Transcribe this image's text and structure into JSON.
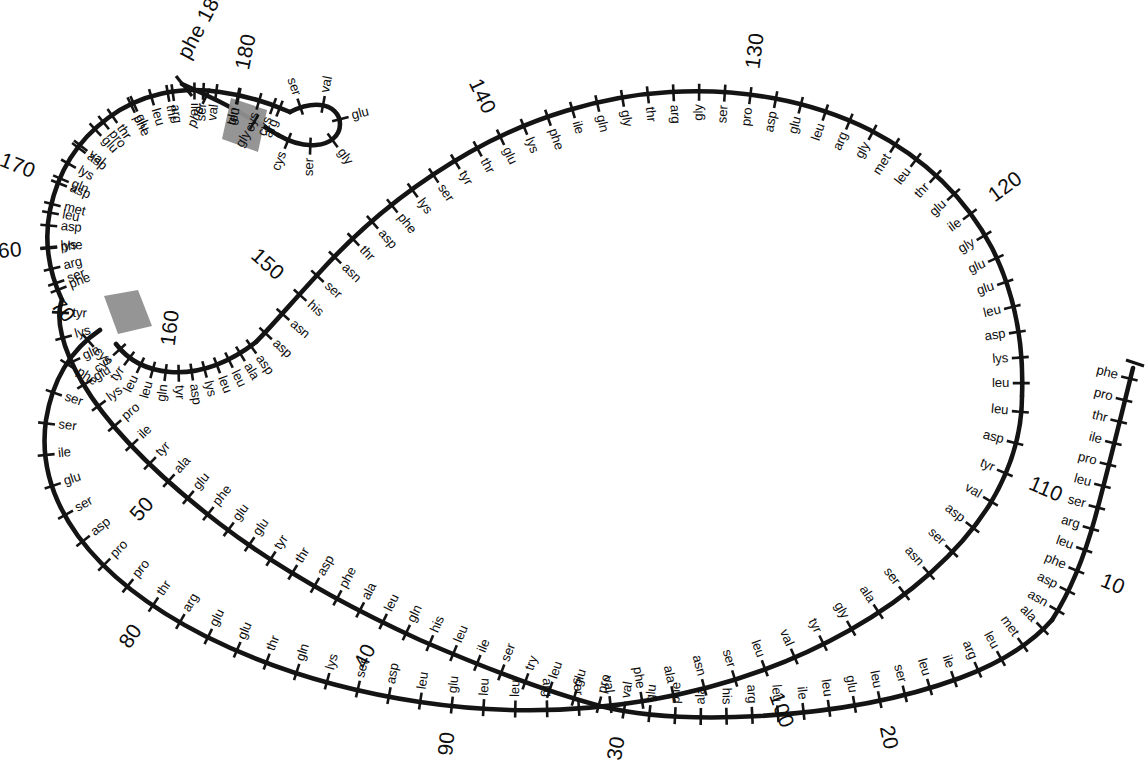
{
  "figure": {
    "type": "protein-sequence-loop-diagram",
    "title": "",
    "total_residues": 188,
    "numbering_interval": 10,
    "ink_color": "#141414",
    "disulfide_color": "#8f8f8f"
  },
  "chart_data": {
    "type": "diagram",
    "title": "",
    "xlabel": "",
    "ylabel": "",
    "numbering_labels": [
      "10",
      "20",
      "30",
      "40",
      "50",
      "60",
      "70",
      "80",
      "90",
      "100",
      "110",
      "120",
      "130",
      "140",
      "150",
      "160",
      "170",
      "180",
      "188"
    ],
    "disulfide_bonds": [
      {
        "label": "cys70-cys161",
        "from_residue": 70,
        "from_name": "cys",
        "to_residue": 161,
        "to_name": "cys"
      },
      {
        "label": "cys179-cys184",
        "from_residue": 179,
        "from_name": "cys",
        "to_residue": 184,
        "to_name": "cys"
      }
    ],
    "residues": [
      {
        "n": 1,
        "name": "phe"
      },
      {
        "n": 2,
        "name": "pro"
      },
      {
        "n": 3,
        "name": "thr"
      },
      {
        "n": 4,
        "name": "ile"
      },
      {
        "n": 5,
        "name": "pro"
      },
      {
        "n": 6,
        "name": "leu"
      },
      {
        "n": 7,
        "name": "ser"
      },
      {
        "n": 8,
        "name": "arg"
      },
      {
        "n": 9,
        "name": "leu"
      },
      {
        "n": 10,
        "name": "phe"
      },
      {
        "n": 11,
        "name": "asp"
      },
      {
        "n": 12,
        "name": "asn"
      },
      {
        "n": 13,
        "name": "ala"
      },
      {
        "n": 14,
        "name": "met"
      },
      {
        "n": 15,
        "name": "leu"
      },
      {
        "n": 16,
        "name": "arg"
      },
      {
        "n": 17,
        "name": "ile"
      },
      {
        "n": 18,
        "name": "leu"
      },
      {
        "n": 19,
        "name": "ser"
      },
      {
        "n": 20,
        "name": "leu"
      },
      {
        "n": 21,
        "name": "glu"
      },
      {
        "n": 22,
        "name": "leu"
      },
      {
        "n": 23,
        "name": "ile"
      },
      {
        "n": 24,
        "name": "leu"
      },
      {
        "n": 25,
        "name": "arg"
      },
      {
        "n": 26,
        "name": "his"
      },
      {
        "n": 27,
        "name": "ala"
      },
      {
        "n": 28,
        "name": "phe"
      },
      {
        "n": 29,
        "name": "glu"
      },
      {
        "n": 30,
        "name": "val"
      },
      {
        "n": 31,
        "name": "pro"
      },
      {
        "n": 32,
        "name": "glu"
      },
      {
        "n": 33,
        "name": "leu"
      },
      {
        "n": 34,
        "name": "try"
      },
      {
        "n": 35,
        "name": "ser"
      },
      {
        "n": 36,
        "name": "ile"
      },
      {
        "n": 37,
        "name": "leu"
      },
      {
        "n": 38,
        "name": "his"
      },
      {
        "n": 39,
        "name": "gln"
      },
      {
        "n": 40,
        "name": "leu"
      },
      {
        "n": 41,
        "name": "ala"
      },
      {
        "n": 42,
        "name": "phe"
      },
      {
        "n": 43,
        "name": "asp"
      },
      {
        "n": 44,
        "name": "thr"
      },
      {
        "n": 45,
        "name": "tyr"
      },
      {
        "n": 46,
        "name": "glu"
      },
      {
        "n": 47,
        "name": "glu"
      },
      {
        "n": 48,
        "name": "phe"
      },
      {
        "n": 49,
        "name": "glu"
      },
      {
        "n": 50,
        "name": "ala"
      },
      {
        "n": 51,
        "name": "tyr"
      },
      {
        "n": 52,
        "name": "ile"
      },
      {
        "n": 53,
        "name": "pro"
      },
      {
        "n": 54,
        "name": "lys"
      },
      {
        "n": 55,
        "name": "glu"
      },
      {
        "n": 56,
        "name": "gln"
      },
      {
        "n": 57,
        "name": "lys"
      },
      {
        "n": 58,
        "name": "tyr"
      },
      {
        "n": 59,
        "name": "ser"
      },
      {
        "n": 60,
        "name": "phe"
      },
      {
        "n": 61,
        "name": "leu"
      },
      {
        "n": 62,
        "name": "gln"
      },
      {
        "n": 63,
        "name": "asp"
      },
      {
        "n": 64,
        "name": "pro"
      },
      {
        "n": 65,
        "name": "glu"
      },
      {
        "n": 66,
        "name": "thr"
      },
      {
        "n": 67,
        "name": "ser"
      },
      {
        "n": 68,
        "name": "leu"
      },
      {
        "n": 69,
        "name": "cys"
      },
      {
        "n": 70,
        "name": "cys"
      },
      {
        "n": 71,
        "name": "phe"
      },
      {
        "n": 72,
        "name": "ser"
      },
      {
        "n": 73,
        "name": "ser"
      },
      {
        "n": 74,
        "name": "ile"
      },
      {
        "n": 75,
        "name": "glu"
      },
      {
        "n": 76,
        "name": "ser"
      },
      {
        "n": 77,
        "name": "asp"
      },
      {
        "n": 78,
        "name": "pro"
      },
      {
        "n": 79,
        "name": "pro"
      },
      {
        "n": 80,
        "name": "thr"
      },
      {
        "n": 81,
        "name": "arg"
      },
      {
        "n": 82,
        "name": "glu"
      },
      {
        "n": 83,
        "name": "glu"
      },
      {
        "n": 84,
        "name": "thr"
      },
      {
        "n": 85,
        "name": "gln"
      },
      {
        "n": 86,
        "name": "lys"
      },
      {
        "n": 87,
        "name": "ser"
      },
      {
        "n": 88,
        "name": "asp"
      },
      {
        "n": 89,
        "name": "leu"
      },
      {
        "n": 90,
        "name": "glu"
      },
      {
        "n": 91,
        "name": "leu"
      },
      {
        "n": 92,
        "name": "leu"
      },
      {
        "n": 93,
        "name": "arg"
      },
      {
        "n": 94,
        "name": "ser"
      },
      {
        "n": 95,
        "name": "val"
      },
      {
        "n": 96,
        "name": "phe"
      },
      {
        "n": 97,
        "name": "ala"
      },
      {
        "n": 98,
        "name": "asn"
      },
      {
        "n": 99,
        "name": "ser"
      },
      {
        "n": 100,
        "name": "leu"
      },
      {
        "n": 101,
        "name": "val"
      },
      {
        "n": 102,
        "name": "tyr"
      },
      {
        "n": 103,
        "name": "gly"
      },
      {
        "n": 104,
        "name": "ala"
      },
      {
        "n": 105,
        "name": "ser"
      },
      {
        "n": 106,
        "name": "asn"
      },
      {
        "n": 107,
        "name": "ser"
      },
      {
        "n": 108,
        "name": "asp"
      },
      {
        "n": 109,
        "name": "val"
      },
      {
        "n": 110,
        "name": "tyr"
      },
      {
        "n": 111,
        "name": "asp"
      },
      {
        "n": 112,
        "name": "leu"
      },
      {
        "n": 113,
        "name": "leu"
      },
      {
        "n": 114,
        "name": "lys"
      },
      {
        "n": 115,
        "name": "asp"
      },
      {
        "n": 116,
        "name": "leu"
      },
      {
        "n": 117,
        "name": "glu"
      },
      {
        "n": 118,
        "name": "glu"
      },
      {
        "n": 119,
        "name": "gly"
      },
      {
        "n": 120,
        "name": "ile"
      },
      {
        "n": 121,
        "name": "glu"
      },
      {
        "n": 122,
        "name": "thr"
      },
      {
        "n": 123,
        "name": "leu"
      },
      {
        "n": 124,
        "name": "met"
      },
      {
        "n": 125,
        "name": "gly"
      },
      {
        "n": 126,
        "name": "arg"
      },
      {
        "n": 127,
        "name": "leu"
      },
      {
        "n": 128,
        "name": "glu"
      },
      {
        "n": 129,
        "name": "asp"
      },
      {
        "n": 130,
        "name": "pro"
      },
      {
        "n": 131,
        "name": "ser"
      },
      {
        "n": 132,
        "name": "gly"
      },
      {
        "n": 133,
        "name": "arg"
      },
      {
        "n": 134,
        "name": "thr"
      },
      {
        "n": 135,
        "name": "gly"
      },
      {
        "n": 136,
        "name": "gln"
      },
      {
        "n": 137,
        "name": "ile"
      },
      {
        "n": 138,
        "name": "phe"
      },
      {
        "n": 139,
        "name": "lys"
      },
      {
        "n": 140,
        "name": "glu"
      },
      {
        "n": 141,
        "name": "thr"
      },
      {
        "n": 142,
        "name": "tyr"
      },
      {
        "n": 143,
        "name": "ser"
      },
      {
        "n": 144,
        "name": "lys"
      },
      {
        "n": 145,
        "name": "phe"
      },
      {
        "n": 146,
        "name": "asp"
      },
      {
        "n": 147,
        "name": "thr"
      },
      {
        "n": 148,
        "name": "asn"
      },
      {
        "n": 149,
        "name": "ser"
      },
      {
        "n": 150,
        "name": "his"
      },
      {
        "n": 151,
        "name": "asn"
      },
      {
        "n": 152,
        "name": "asp"
      },
      {
        "n": 153,
        "name": "asp"
      },
      {
        "n": 154,
        "name": "ala"
      },
      {
        "n": 155,
        "name": "leu"
      },
      {
        "n": 156,
        "name": "leu"
      },
      {
        "n": 157,
        "name": "lys"
      },
      {
        "n": 158,
        "name": "asp"
      },
      {
        "n": 159,
        "name": "tyr"
      },
      {
        "n": 160,
        "name": "gln"
      },
      {
        "n": 161,
        "name": "leu"
      },
      {
        "n": 162,
        "name": "leu"
      },
      {
        "n": 163,
        "name": "tyr"
      },
      {
        "n": 164,
        "name": "cys"
      },
      {
        "n": 165,
        "name": "phe"
      },
      {
        "n": 166,
        "name": "arg"
      },
      {
        "n": 167,
        "name": "lys"
      },
      {
        "n": 168,
        "name": "asp"
      },
      {
        "n": 169,
        "name": "met"
      },
      {
        "n": 170,
        "name": "asp"
      },
      {
        "n": 171,
        "name": "lys"
      },
      {
        "n": 172,
        "name": "val"
      },
      {
        "n": 173,
        "name": "glu"
      },
      {
        "n": 174,
        "name": "thr"
      },
      {
        "n": 175,
        "name": "phe"
      },
      {
        "n": 176,
        "name": "leu"
      },
      {
        "n": 177,
        "name": "arg"
      },
      {
        "n": 178,
        "name": "ile"
      },
      {
        "n": 179,
        "name": "val"
      },
      {
        "n": 180,
        "name": "gln"
      },
      {
        "n": 181,
        "name": "cys"
      },
      {
        "n": 182,
        "name": "arg"
      },
      {
        "n": 183,
        "name": "ser"
      },
      {
        "n": 184,
        "name": "val"
      },
      {
        "n": 185,
        "name": "glu"
      },
      {
        "n": 186,
        "name": "gly"
      },
      {
        "n": 187,
        "name": "ser"
      },
      {
        "n": 188,
        "name": "cys"
      },
      {
        "n": 189,
        "name": "gly"
      },
      {
        "n": 190,
        "name": "phe"
      }
    ]
  },
  "labels": {
    "n_terminus": "phe",
    "c_terminus": "phe 188",
    "marker_188": "188",
    "marker_180": "180",
    "marker_170": "170",
    "marker_160": "160",
    "marker_150": "150",
    "marker_140": "140",
    "marker_130": "130",
    "marker_120": "120",
    "marker_110": "110",
    "marker_100": "100",
    "marker_90": "90",
    "marker_80": "80",
    "marker_70": "70",
    "marker_60": "60",
    "marker_50": "50",
    "marker_40": "40",
    "marker_30": "30",
    "marker_20": "20",
    "marker_10": "10"
  },
  "segments": {
    "n_term_chain": [
      "phe",
      "pro",
      "thr",
      "ile",
      "pro",
      "leu",
      "ser",
      "arg",
      "leu",
      "phe",
      "asp",
      "asn"
    ],
    "bottom_right_arc": [
      "ala",
      "met",
      "leu",
      "arg",
      "ile",
      "leu",
      "ser",
      "leu",
      "glu",
      "leu",
      "ile",
      "leu",
      "arg",
      "his",
      "ala",
      "phe",
      "glu",
      "val",
      "pro",
      "glu",
      "leu",
      "try",
      "ser",
      "ile"
    ],
    "bottom_arc": [
      "leu",
      "his",
      "gln",
      "leu",
      "ala",
      "phe",
      "asp",
      "thr",
      "tyr",
      "glu",
      "glu",
      "phe",
      "glu",
      "ala",
      "tyr",
      "ile",
      "pro",
      "lys",
      "glu",
      "gln",
      "lys",
      "tyr",
      "ser",
      "phe"
    ],
    "left_turn": [
      "leu",
      "gln",
      "asp",
      "pro",
      "glu",
      "thr",
      "ser",
      "leu",
      "cys"
    ],
    "mid_chain": [
      "cys",
      "phe",
      "ser",
      "ser",
      "ile",
      "glu",
      "ser",
      "asp",
      "pro",
      "pro",
      "thr",
      "arg",
      "glu",
      "glu",
      "thr",
      "gln",
      "lys",
      "ser",
      "asp",
      "leu",
      "glu",
      "leu",
      "leu",
      "arg",
      "ser",
      "val",
      "phe",
      "ala",
      "asn",
      "ser",
      "leu",
      "val",
      "tyr",
      "gly",
      "ala",
      "ser",
      "asn",
      "ser",
      "asp",
      "val",
      "tyr",
      "asp",
      "leu",
      "leu",
      "lys",
      "asp",
      "leu",
      "glu",
      "glu",
      "gly",
      "ile",
      "glu",
      "thr",
      "leu",
      "met",
      "gly",
      "arg",
      "leu",
      "glu",
      "asp",
      "pro",
      "ser",
      "gly",
      "arg",
      "thr",
      "gly",
      "gln",
      "ile",
      "phe",
      "lys",
      "glu",
      "thr",
      "tyr",
      "ser",
      "lys",
      "phe",
      "asp",
      "thr",
      "asn",
      "ser",
      "his",
      "asn",
      "asp",
      "asp",
      "ala",
      "leu",
      "leu",
      "lys",
      "asp",
      "tyr",
      "gln",
      "leu",
      "leu",
      "tyr",
      "cys"
    ],
    "upper_left_return": [
      "phe",
      "arg",
      "lys",
      "asp",
      "met",
      "asp",
      "lys",
      "val",
      "glu",
      "thr",
      "phe",
      "leu",
      "arg",
      "ile",
      "val",
      "gln",
      "cys"
    ],
    "top_hairpin": [
      "arg",
      "ser",
      "val",
      "glu",
      "gly",
      "ser",
      "cys",
      "gly",
      "phe"
    ]
  }
}
